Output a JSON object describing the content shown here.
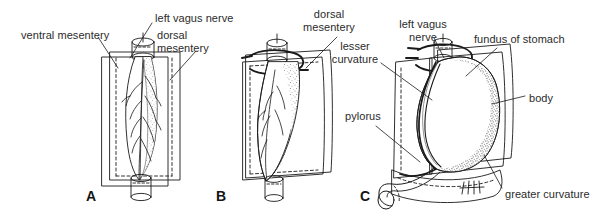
{
  "figure": {
    "background_color": "#ffffff",
    "ink_color": "#1a1a1a",
    "text_color": "#2b2b2b",
    "width": 615,
    "height": 221
  },
  "panels": [
    {
      "letter": "A",
      "letter_x": 86,
      "letter_y": 188,
      "description": "Fusiform stomach in median plane with ventral and dorsal mesenteries"
    },
    {
      "letter": "B",
      "letter_x": 216,
      "letter_y": 188,
      "description": "Stomach beginning rotation, dorsal mesentery expanding"
    },
    {
      "letter": "C",
      "letter_x": 360,
      "letter_y": 188,
      "description": "Rotated stomach showing fundus, body, lesser and greater curvature"
    }
  ],
  "labels": [
    {
      "id": "ventral-mesentery",
      "text": "ventral mesentery",
      "x": 21,
      "y": 29,
      "align": "left",
      "panel": "A"
    },
    {
      "id": "left-vagus-nerve-a",
      "text": "left vagus nerve",
      "x": 155,
      "y": 12,
      "align": "left",
      "panel": "A"
    },
    {
      "id": "dorsal-mesentery-a",
      "text": "dorsal\nmesentery",
      "x": 157,
      "y": 29,
      "align": "left",
      "panel": "A"
    },
    {
      "id": "dorsal-mesentery-b",
      "text": "dorsal\nmesentery",
      "x": 329,
      "y": 8,
      "align": "center",
      "panel": "B"
    },
    {
      "id": "lesser-curvature",
      "text": "lesser\ncurvature",
      "x": 355,
      "y": 40,
      "align": "center",
      "panel": "C"
    },
    {
      "id": "pylorus",
      "text": "pylorus",
      "x": 345,
      "y": 110,
      "align": "left",
      "panel": "C"
    },
    {
      "id": "left-vagus-nerve-c",
      "text": "left vagus\nnerve",
      "x": 423,
      "y": 18,
      "align": "center",
      "panel": "C"
    },
    {
      "id": "fundus-of-stomach",
      "text": "fundus of stomach",
      "x": 474,
      "y": 33,
      "align": "left",
      "panel": "C"
    },
    {
      "id": "body",
      "text": "body",
      "x": 529,
      "y": 92,
      "align": "left",
      "panel": "C"
    },
    {
      "id": "greater-curvature",
      "text": "greater curvature",
      "x": 505,
      "y": 188,
      "align": "left",
      "panel": "C"
    }
  ]
}
